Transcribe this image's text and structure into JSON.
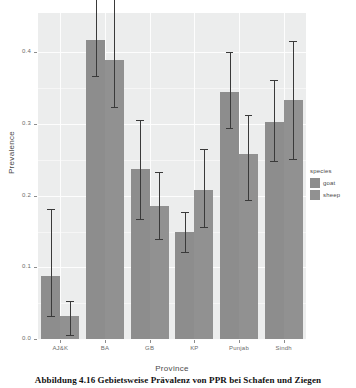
{
  "caption": "Abbildung 4.16 Gebietsweise Prävalenz von PPR bei Schafen und Ziegen",
  "legend": {
    "title": "species",
    "entries": [
      {
        "label": "goat",
        "color": "#8d8d8d"
      },
      {
        "label": "sheep",
        "color": "#919191"
      }
    ]
  },
  "chart_data": {
    "type": "bar",
    "title": "",
    "subtitle": "",
    "xlabel": "Province",
    "ylabel": "Prevalence",
    "categories": [
      "AJ&K",
      "BA",
      "GB",
      "KP",
      "Punjab",
      "Sindh"
    ],
    "series": [
      {
        "name": "goat",
        "color": "#8d8d8d",
        "values": [
          0.088,
          0.417,
          0.237,
          0.15,
          0.345,
          0.303
        ],
        "error_low": [
          0.032,
          0.367,
          0.168,
          0.122,
          0.294,
          0.248
        ],
        "error_high": [
          0.182,
          0.5,
          0.305,
          0.177,
          0.4,
          0.362
        ]
      },
      {
        "name": "sheep",
        "color": "#919191",
        "values": [
          0.032,
          0.389,
          0.185,
          0.208,
          0.258,
          0.333
        ],
        "error_low": [
          0.005,
          0.324,
          0.139,
          0.157,
          0.194,
          0.251
        ],
        "error_high": [
          0.053,
          0.501,
          0.233,
          0.265,
          0.312,
          0.416
        ]
      }
    ],
    "ylim": [
      0.0,
      0.455
    ],
    "yticks": [
      0.0,
      0.1,
      0.2,
      0.3,
      0.4
    ],
    "ytick_labels": [
      "0.0",
      "0.1",
      "0.2",
      "0.3",
      "0.4"
    ],
    "grid": true,
    "legend_position": "right",
    "panel_background": "#eceded",
    "errorbar_color": "#3a3a3a"
  }
}
